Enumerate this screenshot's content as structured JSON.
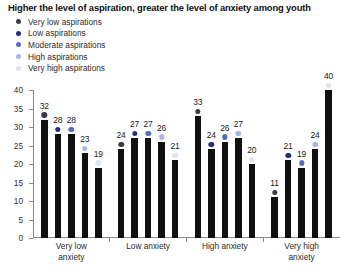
{
  "title": "Higher the level of aspiration, greater the level of anxiety among youth",
  "legend": {
    "items": [
      {
        "label": "Very low aspirations",
        "color": "#3a3a46"
      },
      {
        "label": "Low aspirations",
        "color": "#26307a"
      },
      {
        "label": "Moderate aspirations",
        "color": "#5a6bbf"
      },
      {
        "label": "High aspirations",
        "color": "#aab7e2"
      },
      {
        "label": "Very high aspirations",
        "color": "#dde3f4"
      }
    ]
  },
  "axis": {
    "y_ticks": [
      0,
      5,
      10,
      15,
      20,
      25,
      30,
      35,
      40
    ],
    "y_min": 0,
    "y_max": 40
  },
  "chart_data": {
    "type": "bar",
    "title": "Higher the level of aspiration, greater the level of anxiety among youth",
    "xlabel": "",
    "ylabel": "",
    "ylim": [
      0,
      40
    ],
    "grid": false,
    "legend_position": "top-left",
    "categories": [
      "Very low anxiety",
      "Low anxiety",
      "High anxiety",
      "Very high anxiety"
    ],
    "category_lines": [
      [
        "Very low",
        "anxiety"
      ],
      [
        "Low anxiety"
      ],
      [
        "High anxiety"
      ],
      [
        "Very high",
        "anxiety"
      ]
    ],
    "series": [
      {
        "name": "Very low aspirations",
        "color": "#3a3a46",
        "values": [
          32,
          24,
          33,
          11
        ]
      },
      {
        "name": "Low aspirations",
        "color": "#26307a",
        "values": [
          28,
          27,
          24,
          21
        ]
      },
      {
        "name": "Moderate aspirations",
        "color": "#5a6bbf",
        "values": [
          28,
          27,
          26,
          19
        ]
      },
      {
        "name": "High aspirations",
        "color": "#aab7e2",
        "values": [
          23,
          26,
          27,
          24
        ]
      },
      {
        "name": "Very high aspirations",
        "color": "#dde3f4",
        "values": [
          19,
          21,
          20,
          40
        ]
      }
    ],
    "bar_color": "#101010",
    "marker_shape": "circle",
    "data_labels": true
  }
}
